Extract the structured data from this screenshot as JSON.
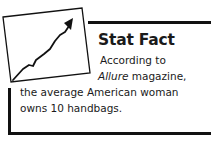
{
  "callout": {
    "title": "Stat Fact",
    "lines": {
      "l1": "According to",
      "l2_italic": "Allure",
      "l2_rest": " magazine,",
      "l3": "the average American woman",
      "l4": "owns 10 handbags."
    },
    "icon": "rising-trend-chart-icon",
    "border_color": "#111111"
  }
}
